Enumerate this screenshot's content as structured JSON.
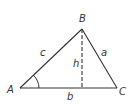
{
  "diagram": {
    "title": "",
    "type": "triangle",
    "vertices": {
      "A": {
        "label": "A",
        "x": 20,
        "y": 88
      },
      "B": {
        "label": "B",
        "x": 82,
        "y": 29
      },
      "C": {
        "label": "C",
        "x": 117,
        "y": 88
      }
    },
    "sides": {
      "a": {
        "label": "a",
        "from": "B",
        "to": "C"
      },
      "b": {
        "label": "b",
        "from": "A",
        "to": "C"
      },
      "c": {
        "label": "c",
        "from": "A",
        "to": "B"
      }
    },
    "height": {
      "label": "h",
      "from": "B",
      "to_foot_x": 82,
      "style": "dashed"
    },
    "angle_marker": {
      "vertex": "A"
    },
    "colors": {
      "line": "#333333",
      "background": "#ffffff"
    }
  }
}
